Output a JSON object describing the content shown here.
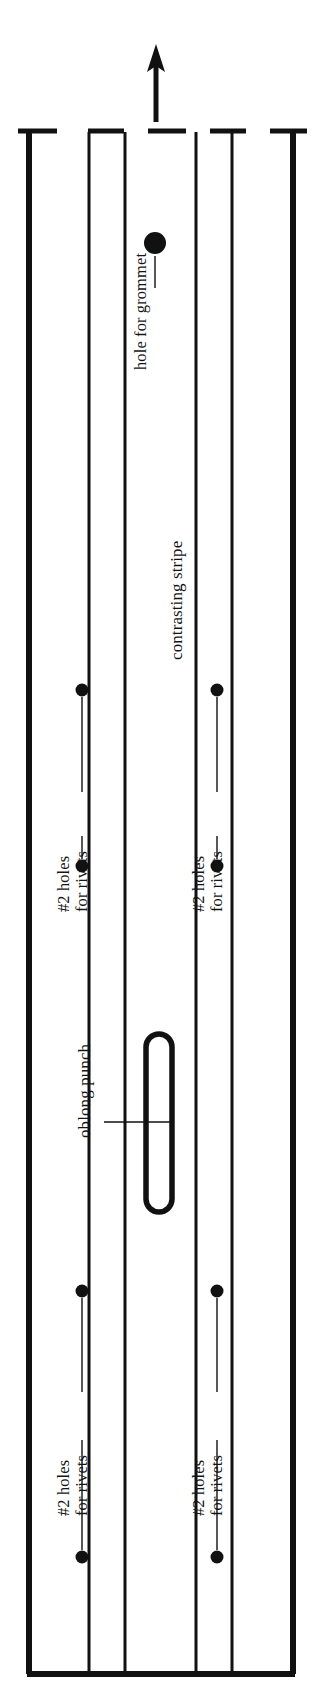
{
  "diagram": {
    "type": "technical-line-drawing",
    "ink_color": "#111111",
    "background_color": "#ffffff",
    "direction_arrow": {
      "name": "up-arrow",
      "meaning": "grain / up direction",
      "x": 155,
      "y_tip": 48,
      "y_tail": 128
    },
    "panel_edges_x": [
      26,
      88,
      125,
      196,
      232,
      296
    ],
    "tick_marks_y": 130,
    "bottom_edge_y": 1676,
    "labels": {
      "grommet": "hole for grommet",
      "stripe": "contrasting stripe",
      "oblong": "oblong punch",
      "rivets_line1": "#2 holes",
      "rivets_line2": "for rivets"
    },
    "features": [
      {
        "name": "grommet-hole",
        "shape": "circle",
        "cx": 155,
        "cy": 243,
        "r": 11
      },
      {
        "name": "oblong-punch",
        "shape": "stadium",
        "x": 144,
        "y": 1032,
        "w": 27,
        "h": 182,
        "stroke": 5
      },
      {
        "name": "rivet-hole-upper-left-top",
        "shape": "circle",
        "cx": 82,
        "cy": 690,
        "r": 6
      },
      {
        "name": "rivet-hole-upper-left-bottom",
        "shape": "circle",
        "cx": 82,
        "cy": 866,
        "r": 6
      },
      {
        "name": "rivet-hole-upper-right-top",
        "shape": "circle",
        "cx": 217,
        "cy": 690,
        "r": 6
      },
      {
        "name": "rivet-hole-upper-right-bottom",
        "shape": "circle",
        "cx": 217,
        "cy": 866,
        "r": 6
      },
      {
        "name": "rivet-hole-lower-left-top",
        "shape": "circle",
        "cx": 82,
        "cy": 1291,
        "r": 6
      },
      {
        "name": "rivet-hole-lower-left-bottom",
        "shape": "circle",
        "cx": 82,
        "cy": 1557,
        "r": 6
      },
      {
        "name": "rivet-hole-lower-right-top",
        "shape": "circle",
        "cx": 217,
        "cy": 1291,
        "r": 6
      },
      {
        "name": "rivet-hole-lower-right-bottom",
        "shape": "circle",
        "cx": 217,
        "cy": 1557,
        "r": 6
      }
    ],
    "counts": {
      "rivet_hole_groups": 4,
      "rivet_holes_per_group": 2,
      "grommet_holes": 1,
      "oblong_punches": 1
    }
  }
}
